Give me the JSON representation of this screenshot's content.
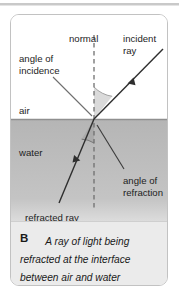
{
  "figure": {
    "letter": "B",
    "caption": "A ray of light being refracted at the interface between air and water",
    "labels": {
      "normal": "normal",
      "incident_ray": "incident\nray",
      "angle_of_incidence": "angle of\nincidence",
      "air": "air",
      "water": "water",
      "angle_of_refraction": "angle of\nrefraction",
      "refracted_ray": "refracted ray"
    },
    "colors": {
      "water_fill": "#b3b3b3",
      "air_fill": "#ffffff",
      "interface_line": "#8f8f8f",
      "ray_stroke": "#2e2e2e",
      "normal_dash": "#7a7a7a",
      "angle_wedge": "#d8d8d8",
      "caption_bg": "#ebebeb",
      "card_border": "#c2c2c2",
      "leader_line": "#6e6e6e"
    },
    "geometry": {
      "interface_y": 104,
      "intersection_x": 83,
      "intersection_y": 104,
      "normal_top_y": 20,
      "normal_bottom_y": 196,
      "incident_start": [
        152,
        34
      ],
      "refracted_end": [
        48,
        188
      ]
    }
  }
}
